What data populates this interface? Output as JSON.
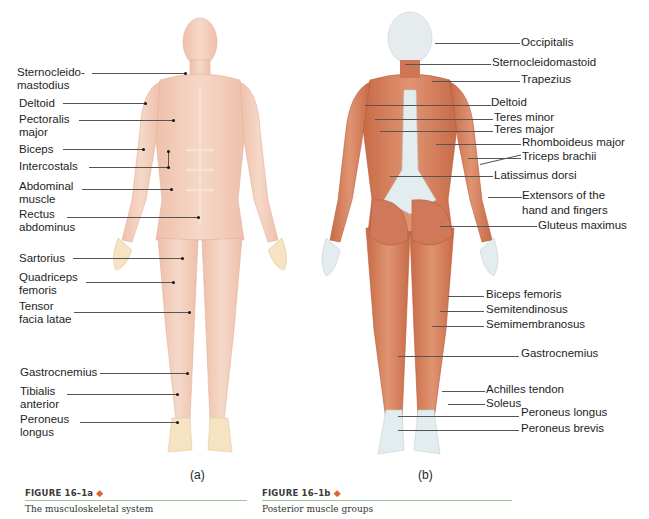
{
  "top_fragment": "ing ... app...",
  "figure_a": {
    "sublabel": "(a)",
    "caption_head": "FIGURE 16–1a",
    "caption_text": "The musculoskeletal system",
    "labels": [
      {
        "text": "Sternocleido-\nmastodius",
        "line1": "Sternocleido-",
        "line2": "mastodius"
      },
      {
        "text": "Deltoid"
      },
      {
        "line1": "Pectoralis",
        "line2": "major"
      },
      {
        "text": "Biceps"
      },
      {
        "text": "Intercostals"
      },
      {
        "line1": "Abdominal",
        "line2": "muscle"
      },
      {
        "line1": "Rectus",
        "line2": "abdominus"
      },
      {
        "text": "Sartorius"
      },
      {
        "line1": "Quadriceps",
        "line2": "femoris"
      },
      {
        "line1": "Tensor",
        "line2": "facia latae"
      },
      {
        "text": "Gastrocnemius"
      },
      {
        "line1": "Tibialis",
        "line2": "anterior"
      },
      {
        "line1": "Peroneus",
        "line2": "longus"
      }
    ]
  },
  "figure_b": {
    "sublabel": "(b)",
    "caption_head": "FIGURE 16–1b",
    "caption_text": "Posterior muscle groups",
    "labels": [
      {
        "text": "Occipitalis"
      },
      {
        "text": "Sternocleidomastoid"
      },
      {
        "text": "Trapezius"
      },
      {
        "text": "Deltoid"
      },
      {
        "text": "Teres minor"
      },
      {
        "text": "Teres major"
      },
      {
        "text": "Rhomboideus major"
      },
      {
        "text": "Triceps brachii"
      },
      {
        "text": "Latissimus dorsi"
      },
      {
        "line1": "Extensors of the",
        "line2": "hand and fingers"
      },
      {
        "text": "Gluteus maximus"
      },
      {
        "text": "Biceps femoris"
      },
      {
        "text": "Semitendinosus"
      },
      {
        "text": "Semimembranosus"
      },
      {
        "text": "Gastrocnemius"
      },
      {
        "text": "Achilles tendon"
      },
      {
        "text": "Soleus"
      },
      {
        "text": "Peroneus longus"
      },
      {
        "text": "Peroneus brevis"
      }
    ]
  },
  "colors": {
    "muscle_front": "#f1cbb8",
    "muscle_back": "#d9805c",
    "tendon_back": "#e3ecee",
    "caption_rule": "#9cc79a",
    "diamond": "#e0622a"
  }
}
